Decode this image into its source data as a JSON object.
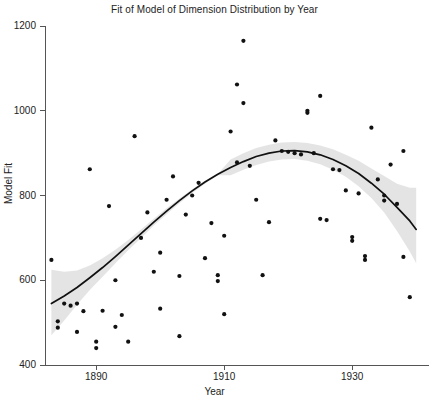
{
  "chart_data": {
    "type": "scatter",
    "title": "Fit of Model of Dimension Distribution by Year",
    "xlabel": "Year",
    "ylabel": "Model Fit",
    "xlim": [
      1882,
      1942
    ],
    "ylim": [
      400,
      1200
    ],
    "xticks": [
      1890,
      1910,
      1930
    ],
    "xtick_labels": [
      "1890",
      "1910",
      "1930"
    ],
    "yticks": [
      400,
      600,
      800,
      1000,
      1200
    ],
    "ytick_labels": [
      "400",
      "600",
      "800",
      "1000",
      "1200"
    ],
    "grid": false,
    "legend": null,
    "point_color": "#111111",
    "line_color": "#111111",
    "band_color": "#e2e2e2",
    "points": [
      [
        1883,
        648
      ],
      [
        1884,
        503
      ],
      [
        1884,
        488
      ],
      [
        1885,
        545
      ],
      [
        1886,
        540
      ],
      [
        1887,
        545
      ],
      [
        1887,
        478
      ],
      [
        1888,
        527
      ],
      [
        1889,
        862
      ],
      [
        1890,
        455
      ],
      [
        1890,
        440
      ],
      [
        1891,
        528
      ],
      [
        1892,
        775
      ],
      [
        1893,
        600
      ],
      [
        1893,
        490
      ],
      [
        1894,
        518
      ],
      [
        1895,
        455
      ],
      [
        1896,
        940
      ],
      [
        1897,
        700
      ],
      [
        1898,
        760
      ],
      [
        1899,
        620
      ],
      [
        1900,
        665
      ],
      [
        1900,
        533
      ],
      [
        1901,
        790
      ],
      [
        1902,
        845
      ],
      [
        1903,
        610
      ],
      [
        1903,
        468
      ],
      [
        1904,
        755
      ],
      [
        1905,
        800
      ],
      [
        1906,
        830
      ],
      [
        1907,
        652
      ],
      [
        1908,
        735
      ],
      [
        1909,
        612
      ],
      [
        1909,
        598
      ],
      [
        1910,
        705
      ],
      [
        1910,
        520
      ],
      [
        1911,
        951
      ],
      [
        1912,
        1062
      ],
      [
        1912,
        878
      ],
      [
        1913,
        1165
      ],
      [
        1913,
        1018
      ],
      [
        1914,
        870
      ],
      [
        1915,
        790
      ],
      [
        1916,
        612
      ],
      [
        1917,
        737
      ],
      [
        1918,
        930
      ],
      [
        1919,
        905
      ],
      [
        1920,
        903
      ],
      [
        1921,
        900
      ],
      [
        1922,
        897
      ],
      [
        1923,
        1000
      ],
      [
        1923,
        995
      ],
      [
        1924,
        900
      ],
      [
        1925,
        1035
      ],
      [
        1925,
        745
      ],
      [
        1926,
        742
      ],
      [
        1927,
        862
      ],
      [
        1928,
        860
      ],
      [
        1929,
        812
      ],
      [
        1930,
        702
      ],
      [
        1930,
        693
      ],
      [
        1931,
        805
      ],
      [
        1932,
        657
      ],
      [
        1932,
        648
      ],
      [
        1933,
        960
      ],
      [
        1934,
        838
      ],
      [
        1935,
        800
      ],
      [
        1935,
        788
      ],
      [
        1936,
        873
      ],
      [
        1937,
        780
      ],
      [
        1938,
        905
      ],
      [
        1938,
        655
      ],
      [
        1939,
        560
      ]
    ],
    "fit_curve": [
      [
        1883,
        545
      ],
      [
        1885,
        563
      ],
      [
        1887,
        583
      ],
      [
        1889,
        606
      ],
      [
        1891,
        630
      ],
      [
        1893,
        656
      ],
      [
        1895,
        683
      ],
      [
        1897,
        710
      ],
      [
        1899,
        737
      ],
      [
        1901,
        763
      ],
      [
        1903,
        788
      ],
      [
        1905,
        811
      ],
      [
        1907,
        832
      ],
      [
        1909,
        850
      ],
      [
        1911,
        866
      ],
      [
        1913,
        880
      ],
      [
        1915,
        892
      ],
      [
        1917,
        900
      ],
      [
        1919,
        905
      ],
      [
        1921,
        906
      ],
      [
        1923,
        903
      ],
      [
        1925,
        896
      ],
      [
        1927,
        885
      ],
      [
        1929,
        870
      ],
      [
        1931,
        852
      ],
      [
        1933,
        829
      ],
      [
        1935,
        803
      ],
      [
        1937,
        772
      ],
      [
        1939,
        740
      ],
      [
        1940,
        720
      ]
    ],
    "ci_upper": [
      [
        1883,
        625
      ],
      [
        1885,
        620
      ],
      [
        1887,
        623
      ],
      [
        1889,
        635
      ],
      [
        1891,
        652
      ],
      [
        1893,
        672
      ],
      [
        1895,
        695
      ],
      [
        1897,
        720
      ],
      [
        1899,
        745
      ],
      [
        1901,
        770
      ],
      [
        1903,
        793
      ],
      [
        1905,
        815
      ],
      [
        1907,
        834
      ],
      [
        1909,
        851
      ],
      [
        1911,
        885
      ],
      [
        1913,
        900
      ],
      [
        1915,
        912
      ],
      [
        1917,
        920
      ],
      [
        1919,
        925
      ],
      [
        1921,
        926
      ],
      [
        1923,
        924
      ],
      [
        1925,
        918
      ],
      [
        1927,
        909
      ],
      [
        1929,
        896
      ],
      [
        1931,
        882
      ],
      [
        1933,
        864
      ],
      [
        1935,
        846
      ],
      [
        1937,
        828
      ],
      [
        1939,
        818
      ],
      [
        1940,
        818
      ]
    ],
    "ci_lower": [
      [
        1883,
        470
      ],
      [
        1885,
        505
      ],
      [
        1887,
        542
      ],
      [
        1889,
        577
      ],
      [
        1891,
        608
      ],
      [
        1893,
        640
      ],
      [
        1895,
        671
      ],
      [
        1897,
        700
      ],
      [
        1899,
        729
      ],
      [
        1901,
        756
      ],
      [
        1903,
        782
      ],
      [
        1905,
        806
      ],
      [
        1907,
        828
      ],
      [
        1909,
        848
      ],
      [
        1911,
        848
      ],
      [
        1913,
        861
      ],
      [
        1915,
        872
      ],
      [
        1917,
        880
      ],
      [
        1919,
        885
      ],
      [
        1921,
        886
      ],
      [
        1923,
        882
      ],
      [
        1925,
        874
      ],
      [
        1927,
        861
      ],
      [
        1929,
        844
      ],
      [
        1931,
        822
      ],
      [
        1933,
        794
      ],
      [
        1935,
        760
      ],
      [
        1937,
        716
      ],
      [
        1939,
        668
      ],
      [
        1940,
        640
      ]
    ]
  }
}
